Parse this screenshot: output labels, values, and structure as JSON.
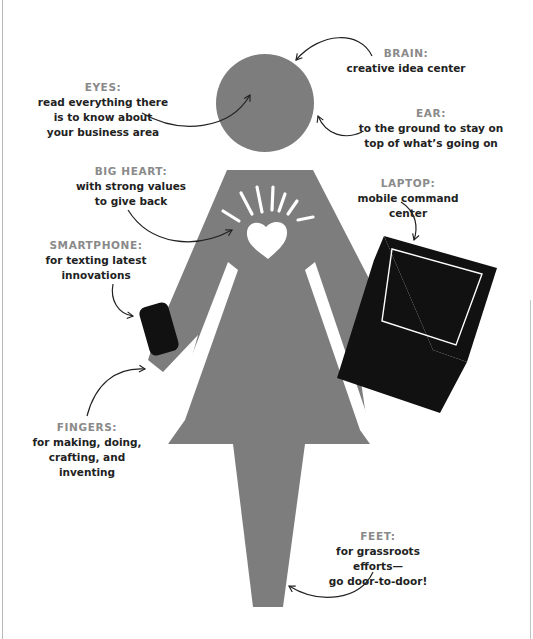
{
  "colors": {
    "figure": "#7d7d7d",
    "device": "#111111",
    "label": "#8a8a8a",
    "text": "#222222",
    "arrow": "#222222",
    "background": "#ffffff"
  },
  "figure": {
    "head": "head-circle",
    "heart": "heart-icon",
    "devices": [
      "smartphone-icon",
      "laptop-icon"
    ]
  },
  "annotations": {
    "brain": {
      "label": "BRAIN:",
      "desc": "creative idea center"
    },
    "eyes": {
      "label": "EYES:",
      "desc": "read everything there\nis to know about\nyour business area"
    },
    "ear": {
      "label": "EAR:",
      "desc": "to the ground to stay on\ntop of what’s going on"
    },
    "heart": {
      "label": "BIG HEART:",
      "desc": "with strong values\nto give back"
    },
    "laptop": {
      "label": "LAPTOP:",
      "desc": "mobile command center"
    },
    "smartphone": {
      "label": "SMARTPHONE:",
      "desc": "for texting latest\ninnovations"
    },
    "fingers": {
      "label": "FINGERS:",
      "desc": "for making, doing,\ncrafting, and inventing"
    },
    "feet": {
      "label": "FEET:",
      "desc": "for grassroots efforts—\ngo door-to-door!"
    }
  }
}
